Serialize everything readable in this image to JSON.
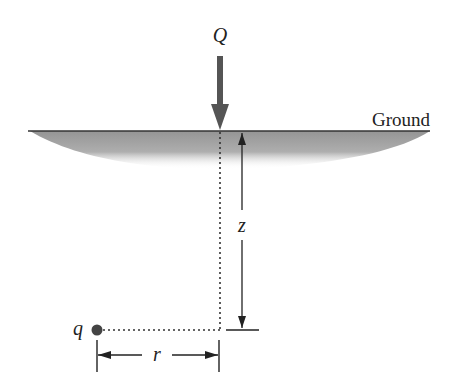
{
  "diagram": {
    "labels": {
      "load": "Q",
      "ground": "Ground",
      "depth": "z",
      "point": "q",
      "radial_distance": "r"
    },
    "colors": {
      "line": "#222222",
      "load_arrow": "#555555",
      "ground_shade": "#9a9a9a",
      "point": "#444444",
      "background": "#ffffff"
    }
  }
}
